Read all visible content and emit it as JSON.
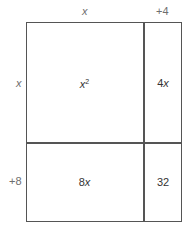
{
  "diagram": {
    "type": "area-model",
    "top_labels": [
      {
        "id": "x",
        "text": "x",
        "italic": true
      },
      {
        "id": "plus4",
        "text": "+4",
        "italic": false
      }
    ],
    "side_labels": [
      {
        "id": "x",
        "text": "x",
        "italic": true
      },
      {
        "id": "plus8",
        "text": "+8",
        "italic": false
      }
    ],
    "cells": [
      {
        "row": 0,
        "col": 0,
        "base": "x",
        "sup": "2",
        "text": "x²"
      },
      {
        "row": 0,
        "col": 1,
        "coef": "4",
        "var": "x",
        "text": "4x"
      },
      {
        "row": 1,
        "col": 0,
        "coef": "8",
        "var": "x",
        "text": "8x"
      },
      {
        "row": 1,
        "col": 1,
        "text": "32"
      }
    ],
    "line_color": "#555555",
    "label_color": "#6e6e6e"
  }
}
